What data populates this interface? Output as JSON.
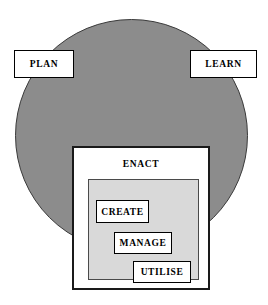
{
  "diagram": {
    "shapes": {
      "cycle_circle": {
        "name": "cycle-circle",
        "fill_color": "#8c8c8c",
        "stroke_color": "#3a3a3a"
      },
      "enact_inner_panel": {
        "name": "enact-inner-panel",
        "fill_color": "#d9d9d9",
        "stroke_color": "#4a4a4a"
      }
    },
    "nodes": {
      "plan": {
        "label": "PLAN"
      },
      "learn": {
        "label": "LEARN"
      },
      "enact": {
        "label": "ENACT"
      },
      "create": {
        "label": "CREATE"
      },
      "manage": {
        "label": "MANAGE"
      },
      "utilise": {
        "label": "UTILISE"
      }
    },
    "colors": {
      "background": "#ffffff",
      "box_fill": "#ffffff",
      "box_stroke": "#000000",
      "circle_fill": "#8c8c8c",
      "inner_fill": "#d9d9d9",
      "text": "#000000"
    }
  }
}
